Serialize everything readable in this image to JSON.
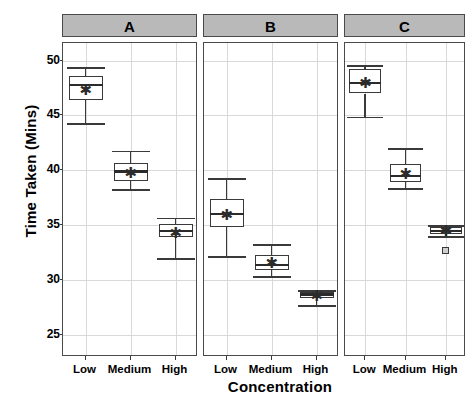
{
  "chart_data": {
    "type": "box",
    "title": "",
    "xlabel": "Concentration",
    "ylabel": "Time Taken (Mins)",
    "ylim": [
      23.0,
      51.6
    ],
    "yticks": [
      25,
      30,
      35,
      40,
      45,
      50
    ],
    "ytick_labels": [
      "25",
      "30",
      "35",
      "40",
      "45",
      "50"
    ],
    "categories": [
      "Low",
      "Medium",
      "High"
    ],
    "grid": true,
    "legend": "none",
    "panel_variable": "Machine",
    "panels": [
      {
        "label": "A",
        "boxes": [
          {
            "category": "Low",
            "whisker_low": 44.3,
            "q1": 46.4,
            "median": 47.8,
            "q3": 48.6,
            "whisker_high": 49.4,
            "mean": 47.3,
            "outliers": []
          },
          {
            "category": "Medium",
            "whisker_low": 38.3,
            "q1": 39.0,
            "median": 39.9,
            "q3": 40.7,
            "whisker_high": 41.8,
            "mean": 39.8,
            "outliers": []
          },
          {
            "category": "High",
            "whisker_low": 32.0,
            "q1": 33.9,
            "median": 34.5,
            "q3": 35.1,
            "whisker_high": 35.7,
            "mean": 34.3,
            "outliers": []
          }
        ]
      },
      {
        "label": "B",
        "boxes": [
          {
            "category": "Low",
            "whisker_low": 32.2,
            "q1": 34.8,
            "median": 36.0,
            "q3": 37.4,
            "whisker_high": 39.3,
            "mean": 35.9,
            "outliers": []
          },
          {
            "category": "Medium",
            "whisker_low": 30.4,
            "q1": 30.9,
            "median": 31.4,
            "q3": 32.3,
            "whisker_high": 33.3,
            "mean": 31.6,
            "outliers": []
          },
          {
            "category": "High",
            "whisker_low": 27.7,
            "q1": 28.4,
            "median": 28.7,
            "q3": 28.9,
            "whisker_high": 29.1,
            "mean": 28.6,
            "outliers": []
          }
        ]
      },
      {
        "label": "C",
        "boxes": [
          {
            "category": "Low",
            "whisker_low": 44.9,
            "q1": 47.0,
            "median": 48.0,
            "q3": 49.2,
            "whisker_high": 49.6,
            "mean": 48.0,
            "outliers": []
          },
          {
            "category": "Medium",
            "whisker_low": 38.4,
            "q1": 38.9,
            "median": 39.5,
            "q3": 40.6,
            "whisker_high": 42.0,
            "mean": 39.7,
            "outliers": []
          },
          {
            "category": "High",
            "whisker_low": 34.0,
            "q1": 34.2,
            "median": 34.5,
            "q3": 34.8,
            "whisker_high": 35.0,
            "mean": 34.5,
            "outliers": [
              32.7
            ]
          }
        ]
      }
    ],
    "mean_marker": "asterisk",
    "colors": {
      "strip_fill": "#b9b9b9",
      "strip_border": "#4a4a4a",
      "axis": "#4a4a4a",
      "grid": "#d9d9d9",
      "box_line": "#3a3a3a",
      "outlier_fill": "#cfcfcf",
      "background": "#ffffff"
    }
  },
  "caption": ""
}
